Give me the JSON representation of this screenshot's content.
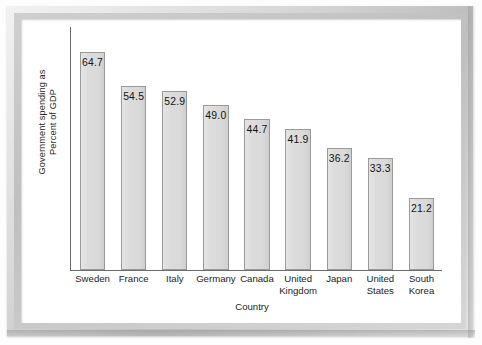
{
  "figure": {
    "frame_color": "#c9c9c9",
    "background_color": "#ffffff"
  },
  "chart_data": {
    "type": "bar",
    "title": "",
    "xlabel": "Country",
    "ylabel": "Government spending as Percent of GDP",
    "ylabel_line1": "Government spending as",
    "ylabel_line2": "Percent of GDP",
    "categories": [
      "Sweden",
      "France",
      "Italy",
      "Germany",
      "Canada",
      "United Kingdom",
      "Japan",
      "United States",
      "South Korea"
    ],
    "values": [
      64.7,
      54.5,
      52.9,
      49.0,
      44.7,
      41.9,
      36.2,
      33.3,
      21.2
    ],
    "value_labels": [
      "64.7",
      "54.5",
      "52.9",
      "49.0",
      "44.7",
      "41.9",
      "36.2",
      "33.3",
      "21.2"
    ],
    "ylim": [
      0,
      72
    ],
    "grid": false,
    "legend": false,
    "bar_fill_color": "#dcdcdc",
    "bar_border_color": "#9a9a9a",
    "axis_color": "#6b6b6b",
    "labels_inside_bars": true
  },
  "bars": [
    {
      "label": "Sweden",
      "label_line1": "Sweden",
      "label_line2": "",
      "value": 64.7,
      "value_label": "64.7"
    },
    {
      "label": "France",
      "label_line1": "France",
      "label_line2": "",
      "value": 54.5,
      "value_label": "54.5"
    },
    {
      "label": "Italy",
      "label_line1": "Italy",
      "label_line2": "",
      "value": 52.9,
      "value_label": "52.9"
    },
    {
      "label": "Germany",
      "label_line1": "Germany",
      "label_line2": "",
      "value": 49.0,
      "value_label": "49.0"
    },
    {
      "label": "Canada",
      "label_line1": "Canada",
      "label_line2": "",
      "value": 44.7,
      "value_label": "44.7"
    },
    {
      "label": "United Kingdom",
      "label_line1": "United",
      "label_line2": "Kingdom",
      "value": 41.9,
      "value_label": "41.9"
    },
    {
      "label": "Japan",
      "label_line1": "Japan",
      "label_line2": "",
      "value": 36.2,
      "value_label": "36.2"
    },
    {
      "label": "United States",
      "label_line1": "United",
      "label_line2": "States",
      "value": 33.3,
      "value_label": "33.3"
    },
    {
      "label": "South Korea",
      "label_line1": "South",
      "label_line2": "Korea",
      "value": 21.2,
      "value_label": "21.2"
    }
  ]
}
